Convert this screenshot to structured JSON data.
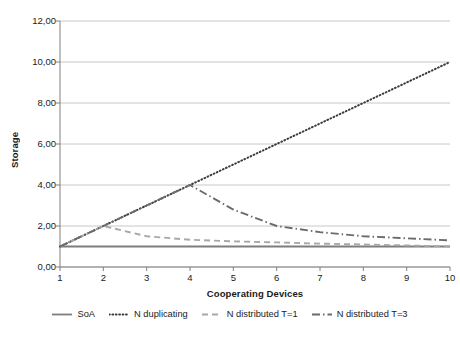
{
  "chart_data": {
    "type": "line",
    "title": "",
    "xlabel": "Cooperating Devices",
    "ylabel": "Storage",
    "x": [
      1,
      2,
      3,
      4,
      5,
      6,
      7,
      8,
      9,
      10
    ],
    "xlim": [
      1,
      10
    ],
    "ylim": [
      0,
      12
    ],
    "xticks": [
      "1",
      "2",
      "3",
      "4",
      "5",
      "6",
      "7",
      "8",
      "9",
      "10"
    ],
    "yticks": [
      "0,00",
      "2,00",
      "4,00",
      "6,00",
      "8,00",
      "10,00",
      "12,00"
    ],
    "ytick_values": [
      0,
      2,
      4,
      6,
      8,
      10,
      12
    ],
    "grid": "horizontal",
    "legend_position": "bottom",
    "series": [
      {
        "name": "SoA",
        "style": "solid",
        "color": "#7d7d7d",
        "values": [
          1.0,
          1.0,
          1.0,
          1.0,
          1.0,
          1.0,
          1.0,
          1.0,
          1.0,
          1.0
        ]
      },
      {
        "name": "N duplicating",
        "style": "dotted",
        "color": "#3c3c3c",
        "values": [
          1.0,
          2.0,
          3.0,
          4.0,
          5.0,
          6.0,
          7.0,
          8.0,
          9.0,
          10.0
        ]
      },
      {
        "name": "N distributed T=1",
        "style": "dashed",
        "color": "#a8a8a8",
        "values": [
          1.0,
          2.0,
          1.5,
          1.33,
          1.25,
          1.2,
          1.14,
          1.1,
          1.05,
          1.0
        ]
      },
      {
        "name": "N distributed T=3",
        "style": "dashdot",
        "color": "#6b6b6b",
        "values": [
          1.0,
          2.0,
          3.0,
          4.0,
          2.8,
          2.0,
          1.7,
          1.5,
          1.4,
          1.3
        ]
      }
    ]
  },
  "axes": {
    "y_title": "Storage",
    "x_title": "Cooperating Devices"
  },
  "colors": {
    "grid": "#c8c8c8",
    "axis": "#808080",
    "text": "#1a1a1a"
  }
}
